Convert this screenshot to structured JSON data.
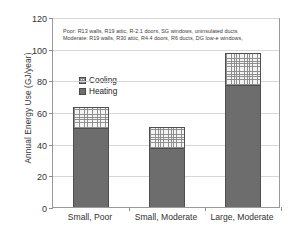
{
  "chart_data": {
    "type": "bar",
    "subtype": "stacked-bar",
    "title": "",
    "xlabel": "",
    "ylabel": "Annual Energy Use (GJ/year)",
    "ylim": [
      0,
      120
    ],
    "yticks": [
      0,
      20,
      40,
      60,
      80,
      100,
      120
    ],
    "ytick_labels": [
      "0",
      "20",
      "40",
      "60",
      "80",
      "100",
      "120"
    ],
    "grid": "horizontal",
    "legend_position": "upper-left-inside",
    "categories": [
      "Small, Poor",
      "Small, Moderate",
      "Large, Moderate"
    ],
    "series": [
      {
        "name": "Heating",
        "values": [
          50,
          37,
          77
        ],
        "color": "#6d6d6d",
        "pattern": "solid"
      },
      {
        "name": "Cooling",
        "values": [
          13,
          13.5,
          20
        ],
        "color": "#f4f4f4",
        "pattern": "grid-crosshatch"
      }
    ],
    "totals": [
      63,
      50.5,
      97
    ],
    "annotations": [
      "Poor: R13 walls, R19 attic, R-2.1 doors, SG windows, uninsulated ducts",
      "Moderate: R19 walls, R30 attic, R4.4 doors, R6 ducts, DG low-e windows,"
    ]
  },
  "axis": {
    "y_title": "Annual Energy Use (GJ/year)",
    "y_ticks": [
      "120",
      "100",
      "80",
      "60",
      "40",
      "20",
      "0"
    ],
    "x_ticks": [
      "Small, Poor",
      "Small, Moderate",
      "Large, Moderate"
    ]
  },
  "legend": {
    "items": [
      {
        "label": "Cooling",
        "swatch": "cooling-swatch"
      },
      {
        "label": "Heating",
        "swatch": "heating-swatch"
      }
    ]
  },
  "note": {
    "line1": "Poor: R13 walls, R19 attic, R-2.1 doors, SG windows, uninsulated ducts",
    "line2": "Moderate: R19 walls, R30 attic, R4.4 doors, R6 ducts, DG low-e windows,"
  }
}
